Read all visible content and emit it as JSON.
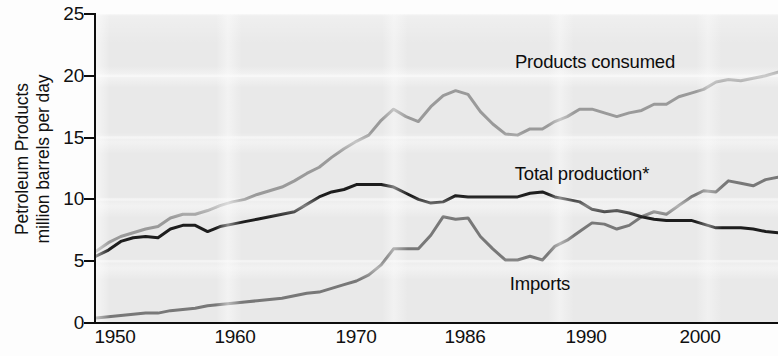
{
  "chart_data": {
    "type": "line",
    "title": "",
    "xlabel": "",
    "ylabel": "Petroleum Products million barrels per day",
    "ylabel_lines": [
      "Petroleum Products",
      "million barrels per day"
    ],
    "xlim": [
      1949,
      2004
    ],
    "ylim": [
      0,
      25
    ],
    "yticks": [
      0,
      5,
      10,
      15,
      20,
      25
    ],
    "ytick_labels": [
      "0",
      "5",
      "10",
      "15",
      "20",
      "25"
    ],
    "xtick_labels": [
      "1950",
      "1960",
      "1970",
      "1986",
      "1990",
      "2000"
    ],
    "xtick_positions_px": [
      115,
      235,
      356,
      465,
      586,
      700
    ],
    "grid": true,
    "grid_color": "#f2f2f2",
    "plot_background": "#e9e9e9",
    "legend_position": "inline-annotations",
    "series": [
      {
        "name": "Products consumed",
        "color": "#9a9a9a",
        "label_text": "Products consumed",
        "x": [
          1949,
          1950,
          1951,
          1952,
          1953,
          1954,
          1955,
          1956,
          1957,
          1958,
          1959,
          1960,
          1961,
          1962,
          1963,
          1964,
          1965,
          1966,
          1967,
          1968,
          1969,
          1970,
          1971,
          1972,
          1973,
          1974,
          1975,
          1976,
          1977,
          1978,
          1979,
          1980,
          1981,
          1982,
          1983,
          1984,
          1985,
          1986,
          1987,
          1988,
          1989,
          1990,
          1991,
          1992,
          1993,
          1994,
          1995,
          1996,
          1997,
          1998,
          1999,
          2000,
          2001,
          2002,
          2003,
          2004
        ],
        "values": [
          5.8,
          6.5,
          7.0,
          7.3,
          7.6,
          7.8,
          8.5,
          8.8,
          8.8,
          9.1,
          9.5,
          9.8,
          10.0,
          10.4,
          10.7,
          11.0,
          11.5,
          12.1,
          12.6,
          13.4,
          14.1,
          14.7,
          15.2,
          16.4,
          17.3,
          16.7,
          16.3,
          17.5,
          18.4,
          18.8,
          18.5,
          17.1,
          16.1,
          15.3,
          15.2,
          15.7,
          15.7,
          16.3,
          16.7,
          17.3,
          17.3,
          17.0,
          16.7,
          17.0,
          17.2,
          17.7,
          17.7,
          18.3,
          18.6,
          18.9,
          19.5,
          19.7,
          19.6,
          19.8,
          20.0,
          20.3
        ]
      },
      {
        "name": "Total production*",
        "color": "#1d1d1d",
        "label_text": "Total production*",
        "x": [
          1949,
          1950,
          1951,
          1952,
          1953,
          1954,
          1955,
          1956,
          1957,
          1958,
          1959,
          1960,
          1961,
          1962,
          1963,
          1964,
          1965,
          1966,
          1967,
          1968,
          1969,
          1970,
          1971,
          1972,
          1973,
          1974,
          1975,
          1976,
          1977,
          1978,
          1979,
          1980,
          1981,
          1982,
          1983,
          1984,
          1985,
          1986,
          1987,
          1988,
          1989,
          1990,
          1991,
          1992,
          1993,
          1994,
          1995,
          1996,
          1997,
          1998,
          1999,
          2000,
          2001,
          2002,
          2003,
          2004
        ],
        "values": [
          5.4,
          5.9,
          6.6,
          6.9,
          7.0,
          6.9,
          7.6,
          7.9,
          7.9,
          7.4,
          7.8,
          8.0,
          8.2,
          8.4,
          8.6,
          8.8,
          9.0,
          9.6,
          10.2,
          10.6,
          10.8,
          11.2,
          11.2,
          11.2,
          11.0,
          10.5,
          10.0,
          9.7,
          9.8,
          10.3,
          10.2,
          10.2,
          10.2,
          10.2,
          10.2,
          10.5,
          10.6,
          10.2,
          10.0,
          9.8,
          9.2,
          9.0,
          9.1,
          8.9,
          8.6,
          8.4,
          8.3,
          8.3,
          8.3,
          8.0,
          7.7,
          7.7,
          7.7,
          7.6,
          7.4,
          7.3
        ]
      },
      {
        "name": "Imports",
        "color": "#787878",
        "label_text": "Imports",
        "x": [
          1949,
          1950,
          1951,
          1952,
          1953,
          1954,
          1955,
          1956,
          1957,
          1958,
          1959,
          1960,
          1961,
          1962,
          1963,
          1964,
          1965,
          1966,
          1967,
          1968,
          1969,
          1970,
          1971,
          1972,
          1973,
          1974,
          1975,
          1976,
          1977,
          1978,
          1979,
          1980,
          1981,
          1982,
          1983,
          1984,
          1985,
          1986,
          1987,
          1988,
          1989,
          1990,
          1991,
          1992,
          1993,
          1994,
          1995,
          1996,
          1997,
          1998,
          1999,
          2000,
          2001,
          2002,
          2003,
          2004
        ],
        "values": [
          0.4,
          0.5,
          0.6,
          0.7,
          0.8,
          0.8,
          1.0,
          1.1,
          1.2,
          1.4,
          1.5,
          1.6,
          1.7,
          1.8,
          1.9,
          2.0,
          2.2,
          2.4,
          2.5,
          2.8,
          3.1,
          3.4,
          3.9,
          4.7,
          6.0,
          6.0,
          6.0,
          7.1,
          8.6,
          8.4,
          8.5,
          7.0,
          6.0,
          5.1,
          5.1,
          5.4,
          5.1,
          6.2,
          6.7,
          7.4,
          8.1,
          8.0,
          7.6,
          7.9,
          8.6,
          9.0,
          8.8,
          9.5,
          10.2,
          10.7,
          10.6,
          11.5,
          11.3,
          11.1,
          11.6,
          11.8
        ]
      }
    ]
  },
  "axis": {
    "y_title_line1": "Petroleum Products",
    "y_title_line2": "million barrels per day"
  },
  "labels": {
    "products_consumed": "Products consumed",
    "total_production": "Total production*",
    "imports": "Imports"
  }
}
